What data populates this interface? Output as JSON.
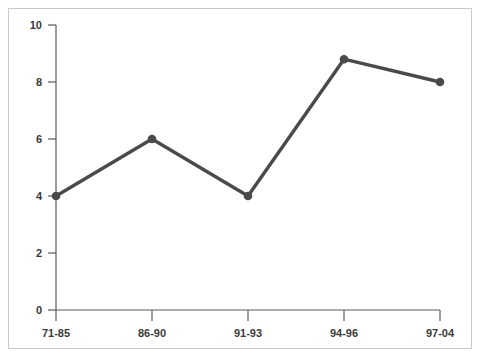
{
  "chart_data": {
    "type": "line",
    "title": "",
    "subtitle": "",
    "xlabel": "",
    "ylabel": "",
    "categories": [
      "71-85",
      "86-90",
      "91-93",
      "94-96",
      "97-04"
    ],
    "values": [
      4,
      6,
      4,
      8.8,
      8
    ],
    "series": [
      {
        "name": "",
        "values": [
          4,
          6,
          4,
          8.8,
          8
        ]
      }
    ],
    "ylim": [
      0,
      10
    ],
    "ytick_labels": [
      "0",
      "2",
      "4",
      "6",
      "8",
      "10"
    ],
    "ytick_values": [
      0,
      2,
      4,
      6,
      8,
      10
    ],
    "grid": false,
    "legend": false,
    "legend_position": "none",
    "annotations": [],
    "marker": "circle",
    "colors": {
      "line": "#4a4a4a",
      "marker": "#4a4a4a",
      "axis": "#5a5a5a",
      "tick_text": "#3a3a3a",
      "frame_border": "#c9c9c9",
      "plot_background": "#ffffff"
    }
  }
}
